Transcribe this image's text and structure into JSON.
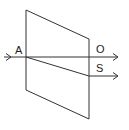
{
  "diagram": {
    "colors": {
      "stroke": "#333333",
      "background": "#ffffff"
    },
    "labels": {
      "entry_point": "A",
      "ordinary_ray": "O",
      "extraordinary_ray": "S"
    },
    "crystal": {
      "points": "26,10 89,39 89,119 26,90"
    }
  }
}
